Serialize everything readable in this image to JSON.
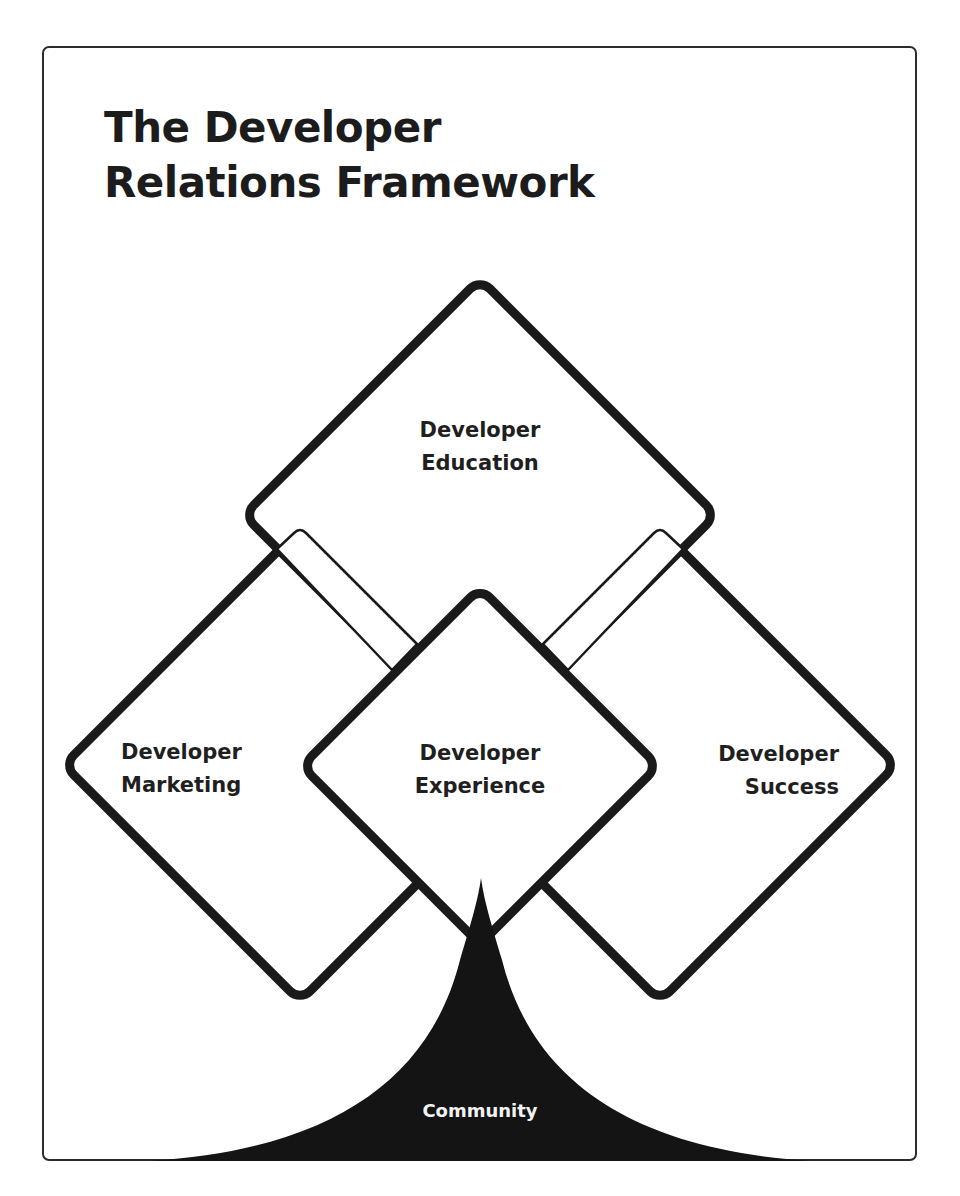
{
  "title": {
    "line1": "The Developer",
    "line2": "Relations Framework"
  },
  "diagram": {
    "stroke_color": "#1a1a1a",
    "fill_color": "#ffffff",
    "nodes": [
      {
        "id": "education",
        "line1": "Developer",
        "line2": "Education"
      },
      {
        "id": "marketing",
        "line1": "Developer",
        "line2": "Marketing"
      },
      {
        "id": "experience",
        "line1": "Developer",
        "line2": "Experience"
      },
      {
        "id": "success",
        "line1": "Developer",
        "line2": "Success"
      }
    ],
    "foundation": {
      "id": "community",
      "label": "Community",
      "fill": "#141414",
      "text_color": "#f2f2f2"
    }
  }
}
